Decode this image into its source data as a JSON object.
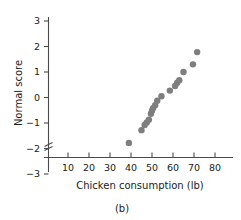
{
  "figure": {
    "caption": "(b)",
    "point_color": "#7e7e7e",
    "axis_color": "#4a4a4a",
    "background": "#ffffff"
  },
  "chart_data": {
    "type": "scatter",
    "title": "",
    "xlabel": "Chicken consumption (lb)",
    "ylabel": "Normal score",
    "xlim": [
      5,
      85
    ],
    "ylim": [
      -3.6,
      3.4
    ],
    "xticks": [
      10,
      20,
      30,
      40,
      50,
      60,
      70,
      80
    ],
    "xtick_labels": [
      "10",
      "20",
      "30",
      "40",
      "50",
      "60",
      "70",
      "80"
    ],
    "yticks": [
      -3,
      -2,
      -1,
      0,
      1,
      2,
      3
    ],
    "ytick_labels": [
      "−3",
      "−2",
      "−1",
      "0",
      "1",
      "2",
      "3"
    ],
    "grid": false,
    "legend": null,
    "axis_break": {
      "axis": "y",
      "below_value": -3,
      "symbol": "zigzag"
    },
    "x": [
      39,
      45,
      46.5,
      47.5,
      48.5,
      49.5,
      50,
      50.5,
      51.5,
      52.5,
      54.5,
      58.5,
      61,
      62,
      63,
      65,
      69.5,
      71.5
    ],
    "y": [
      -1.78,
      -1.28,
      -1.08,
      -0.98,
      -0.87,
      -0.64,
      -0.52,
      -0.42,
      -0.3,
      -0.13,
      0.05,
      0.27,
      0.45,
      0.58,
      0.68,
      1.0,
      1.3,
      1.78
    ],
    "n_points": 18,
    "marker": "circle",
    "marker_size": 3.2
  }
}
